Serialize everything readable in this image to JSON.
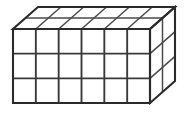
{
  "figure": {
    "title": "Rectangular prism composed of unit cubes",
    "shape_type": "cuboid",
    "projection": "oblique-cabinet",
    "dimensions": {
      "width_cubes": 6,
      "height_cubes": 3,
      "depth_cubes": 2,
      "total_cubes": 36
    },
    "faces": {
      "front": {
        "label": "front-face",
        "columns": 6,
        "rows": 3,
        "visible_cubes": 18
      },
      "top": {
        "label": "top-face",
        "columns": 6,
        "rows": 2,
        "visible_cubes": 12
      },
      "right": {
        "label": "right-face",
        "columns": 2,
        "rows": 3,
        "visible_cubes": 6
      }
    },
    "colors": {
      "background": "#ffffff",
      "outline": "#2b2b2b",
      "gridline": "#3a3a3a",
      "face_fill": "#ffffff"
    },
    "geometry": {
      "front_left_x": 13,
      "front_right_x": 150,
      "front_top_y": 29,
      "front_bottom_y": 103,
      "depth_offset_x": 25,
      "depth_offset_y": -22,
      "cell_width": 22.83,
      "cell_height": 24.67
    },
    "canvas": {
      "width": 188,
      "height": 118
    }
  }
}
